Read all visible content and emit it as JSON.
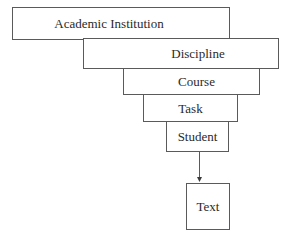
{
  "diagram": {
    "type": "hierarchy",
    "levels": [
      {
        "label": "Academic Institution"
      },
      {
        "label": "Discipline"
      },
      {
        "label": "Course"
      },
      {
        "label": "Task"
      },
      {
        "label": "Student"
      }
    ],
    "output": {
      "label": "Text"
    },
    "edges": [
      {
        "from": "Student",
        "to": "Text",
        "style": "arrow"
      }
    ]
  }
}
